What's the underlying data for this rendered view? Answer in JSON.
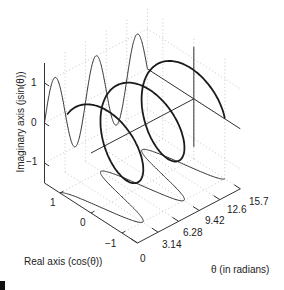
{
  "chart_data": {
    "type": "line",
    "subtype": "3d-helix",
    "title": "",
    "xlabel": "θ (in radians)",
    "ylabel": "Real axis (cos(θ))",
    "zlabel": "Imaginary axis (jsin(θ))",
    "theta_ticks": [
      "0",
      "3.14",
      "6.28",
      "9.42",
      "12.6",
      "15.7"
    ],
    "theta_tick_values": [
      0,
      3.14,
      6.28,
      9.42,
      12.57,
      15.71
    ],
    "real_ticks": [
      "1",
      "0",
      "−1"
    ],
    "real_tick_values": [
      1,
      0,
      -1
    ],
    "imag_ticks": [
      "1",
      "0",
      "−1"
    ],
    "imag_tick_values": [
      1,
      0,
      -1
    ],
    "theta_range": [
      0,
      15.7
    ],
    "real_range": [
      -1.5,
      1.5
    ],
    "imag_range": [
      -1.5,
      1.5
    ],
    "grid": true,
    "series": [
      {
        "name": "helix e^(jθ) = cos(θ) + jsin(θ)",
        "expr": "(θ, cos θ, sin θ)",
        "theta_start": 0.5,
        "theta_end": 15.7,
        "stroke_width": 1.8,
        "color": "#1a1a1a"
      },
      {
        "name": "imaginary projection sin(θ) on back wall",
        "expr": "(θ, 1.5, sin θ)",
        "color": "#333333",
        "stroke_width": 1
      },
      {
        "name": "real projection cos(θ) on floor",
        "expr": "(θ, cos θ, -1.5)",
        "color": "#333333",
        "stroke_width": 1
      }
    ],
    "reference_lines": [
      {
        "name": "theta-axis through origin",
        "from": [
          0,
          0,
          0
        ],
        "to": [
          15.7,
          0,
          0
        ]
      },
      {
        "name": "real-axis at end",
        "from": [
          15.7,
          1.5,
          0
        ],
        "to": [
          15.7,
          -1.5,
          0
        ]
      },
      {
        "name": "imag-axis at end",
        "from": [
          15.7,
          0,
          1.3
        ],
        "to": [
          15.7,
          0,
          -1.2
        ]
      }
    ]
  },
  "colors": {
    "curve": "#1a1a1a",
    "axis": "#333333",
    "grid": "#c8c8c8",
    "text": "#222222"
  }
}
